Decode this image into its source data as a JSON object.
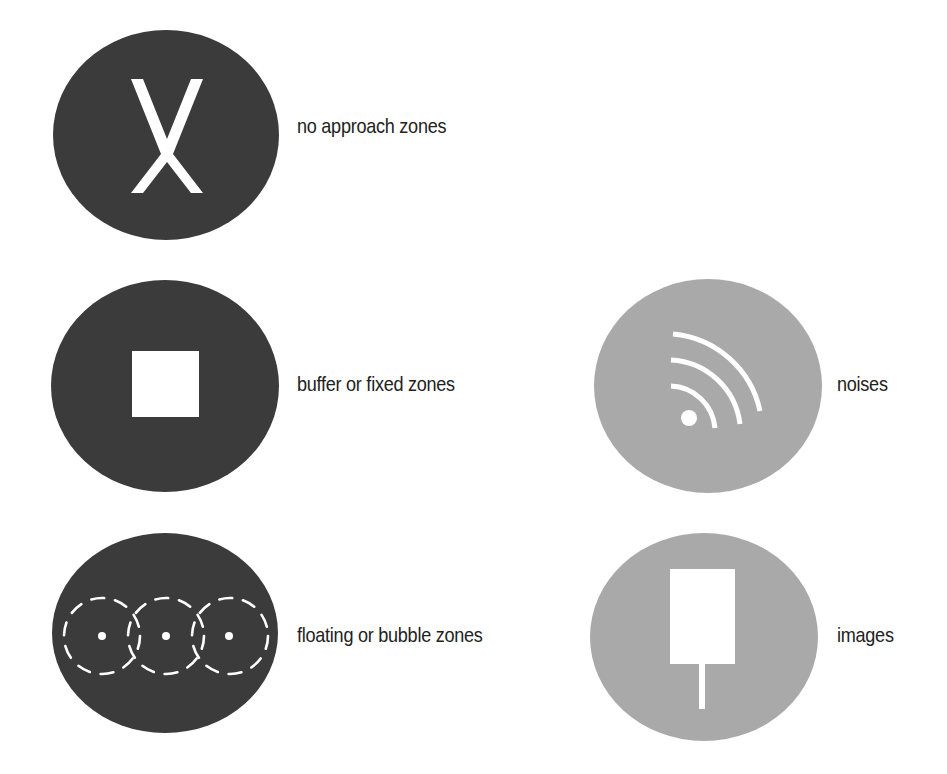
{
  "colors": {
    "dark_circle": "#3b3b3b",
    "light_circle": "#a9a9a9",
    "glyph": "#ffffff",
    "text": "#222222"
  },
  "legend": {
    "items": [
      {
        "id": "no-approach",
        "label": "no approach zones",
        "icon": "x-mark-icon",
        "circle": "dark"
      },
      {
        "id": "buffer",
        "label": "buffer or fixed zones",
        "icon": "square-icon",
        "circle": "dark"
      },
      {
        "id": "floating",
        "label": "floating or bubble zones",
        "icon": "bubble-zones-icon",
        "circle": "dark"
      },
      {
        "id": "noises",
        "label": "noises",
        "icon": "sound-waves-icon",
        "circle": "light"
      },
      {
        "id": "images",
        "label": "images",
        "icon": "camera-sign-icon",
        "circle": "light"
      }
    ]
  }
}
